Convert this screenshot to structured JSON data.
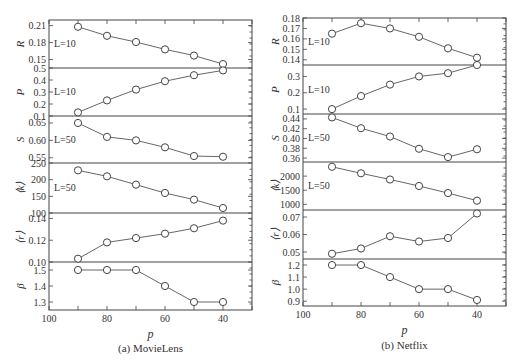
{
  "chart_data": [
    {
      "type": "line",
      "caption": "(a) MovieLens",
      "xlabel": "p",
      "x": [
        90,
        80,
        70,
        60,
        50,
        40
      ],
      "xlim": [
        100,
        30
      ],
      "xticks": [
        100,
        80,
        60,
        40
      ],
      "xticks_minor": [
        90,
        70,
        50,
        30
      ],
      "panels": [
        {
          "ylabel": "R",
          "annotation": "L=10",
          "values": [
            0.208,
            0.192,
            0.181,
            0.168,
            0.157,
            0.142
          ],
          "ylim": [
            0.135,
            0.22
          ],
          "yticks": [
            "0.21",
            "0.18",
            "0.15"
          ]
        },
        {
          "ylabel": "P",
          "annotation": "L=10",
          "values": [
            0.13,
            0.23,
            0.32,
            0.39,
            0.44,
            0.48
          ],
          "ylim": [
            0.1,
            0.5
          ],
          "yticks": [
            "0.5",
            "0.4",
            "0.3",
            "0.2",
            "0.1"
          ]
        },
        {
          "ylabel": "S",
          "annotation": "L=50",
          "values": [
            0.65,
            0.61,
            0.6,
            0.58,
            0.555,
            0.553
          ],
          "ylim": [
            0.535,
            0.67
          ],
          "yticks": [
            "0.65",
            "0.60",
            "0.55"
          ]
        },
        {
          "ylabel": "⟨k⟩",
          "annotation": "L=50",
          "values": [
            228,
            210,
            185,
            160,
            140,
            115
          ],
          "ylim": [
            100,
            250
          ],
          "yticks": [
            "250",
            "200",
            "150",
            "100"
          ]
        },
        {
          "ylabel": "⟨r⟩",
          "annotation": "",
          "values": [
            0.103,
            0.118,
            0.122,
            0.126,
            0.131,
            0.138
          ],
          "ylim": [
            0.1,
            0.145
          ],
          "yticks": [
            "0.14",
            "0.12",
            "0.10"
          ]
        },
        {
          "ylabel": "β",
          "annotation": "",
          "values": [
            1.5,
            1.5,
            1.5,
            1.4,
            1.3,
            1.3
          ],
          "ylim": [
            1.25,
            1.55
          ],
          "yticks": [
            "1.5",
            "1.4",
            "1.3"
          ]
        }
      ]
    },
    {
      "type": "line",
      "caption": "(b) Netflix",
      "xlabel": "p",
      "x": [
        90,
        80,
        70,
        60,
        50,
        40
      ],
      "xlim": [
        100,
        30
      ],
      "xticks": [
        100,
        80,
        60,
        40
      ],
      "xticks_minor": [
        90,
        70,
        50,
        30
      ],
      "panels": [
        {
          "ylabel": "R",
          "annotation": "L=10",
          "values": [
            0.165,
            0.175,
            0.17,
            0.162,
            0.151,
            0.142
          ],
          "ylim": [
            0.135,
            0.18
          ],
          "yticks": [
            "0.18",
            "0.17",
            "0.16",
            "0.15",
            "0.14"
          ]
        },
        {
          "ylabel": "P",
          "annotation": "L=10",
          "values": [
            0.1,
            0.18,
            0.25,
            0.3,
            0.32,
            0.37
          ],
          "ylim": [
            0.07,
            0.37
          ],
          "yticks": [
            "0.3",
            "0.2",
            "0.1"
          ]
        },
        {
          "ylabel": "S",
          "annotation": "L=50",
          "values": [
            0.443,
            0.421,
            0.404,
            0.379,
            0.362,
            0.378
          ],
          "ylim": [
            0.352,
            0.45
          ],
          "yticks": [
            "0.44",
            "0.42",
            "0.40",
            "0.38",
            "0.36"
          ]
        },
        {
          "ylabel": "⟨k⟩",
          "annotation": "L=50",
          "values": [
            2330,
            2100,
            1880,
            1650,
            1400,
            1130
          ],
          "ylim": [
            800,
            2500
          ],
          "yticks": [
            "2000",
            "1500",
            "1000"
          ]
        },
        {
          "ylabel": "⟨r⟩",
          "annotation": "",
          "values": [
            0.049,
            0.052,
            0.059,
            0.056,
            0.058,
            0.072
          ],
          "ylim": [
            0.046,
            0.074
          ],
          "yticks": [
            "0.07",
            "0.06",
            "0.05"
          ]
        },
        {
          "ylabel": "β",
          "annotation": "",
          "values": [
            1.2,
            1.2,
            1.1,
            1.0,
            1.0,
            0.91
          ],
          "ylim": [
            0.86,
            1.25
          ],
          "yticks": [
            "1.2",
            "1.1",
            "1.0",
            "0.9"
          ]
        }
      ]
    }
  ]
}
